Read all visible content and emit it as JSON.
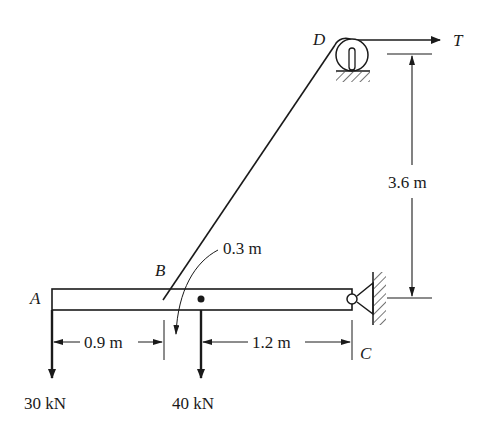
{
  "points": {
    "A": "A",
    "B": "B",
    "C": "C",
    "D": "D"
  },
  "tension": {
    "label": "T"
  },
  "dimensions": {
    "vertical": "3.6 m",
    "offset": "0.3 m",
    "left": "0.9 m",
    "right": "1.2 m"
  },
  "loads": [
    {
      "label": "30 kN",
      "position": "A"
    },
    {
      "label": "40 kN",
      "position": "beam-center"
    }
  ],
  "colors": {
    "ink": "#1a1a1a",
    "background": "#ffffff"
  }
}
